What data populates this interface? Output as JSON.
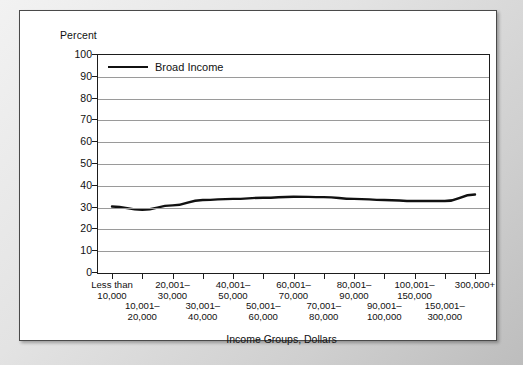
{
  "chart_data": {
    "type": "line",
    "title": "",
    "ylabel": "Percent",
    "xlabel": "Income Groups, Dollars",
    "ylim": [
      0,
      100
    ],
    "yticks": [
      0,
      10,
      20,
      30,
      40,
      50,
      60,
      70,
      80,
      90,
      100
    ],
    "grid": true,
    "legend_position": "top-left",
    "legend": [
      "Broad Income"
    ],
    "categories": [
      "Less than 10,000",
      "10,001– 20,000",
      "20,001– 30,000",
      "30,001– 40,000",
      "40,001– 50,000",
      "50,001– 60,000",
      "60,001– 70,000",
      "70,001– 80,000",
      "80,001– 90,000",
      "90,001– 100,000",
      "100,001– 150,000",
      "150,001– 300,000",
      "300,000+"
    ],
    "category_rows": [
      {
        "row": "a",
        "line1": "Less than",
        "line2": "10,000"
      },
      {
        "row": "b",
        "line1": "10,001–",
        "line2": "20,000"
      },
      {
        "row": "a",
        "line1": "20,001–",
        "line2": "30,000"
      },
      {
        "row": "b",
        "line1": "30,001–",
        "line2": "40,000"
      },
      {
        "row": "a",
        "line1": "40,001–",
        "line2": "50,000"
      },
      {
        "row": "b",
        "line1": "50,001–",
        "line2": "60,000"
      },
      {
        "row": "a",
        "line1": "60,001–",
        "line2": "70,000"
      },
      {
        "row": "b",
        "line1": "70,001–",
        "line2": "80,000"
      },
      {
        "row": "a",
        "line1": "80,001–",
        "line2": "90,000"
      },
      {
        "row": "b",
        "line1": "90,001–",
        "line2": "100,000"
      },
      {
        "row": "a",
        "line1": "100,001–",
        "line2": "150,000"
      },
      {
        "row": "b",
        "line1": "150,001–",
        "line2": "300,000"
      },
      {
        "row": "a",
        "line1": "300,000+",
        "line2": ""
      }
    ],
    "series": [
      {
        "name": "Broad Income",
        "color": "#111111",
        "values": [
          30.5,
          29,
          31,
          33.5,
          34,
          34.5,
          35,
          34.8,
          34,
          33.5,
          33,
          33,
          36
        ]
      }
    ]
  },
  "ytick_labels": [
    "100",
    "90",
    "80",
    "70",
    "60",
    "50",
    "40",
    "30",
    "20",
    "10",
    "0"
  ],
  "legend_label": "Broad Income",
  "y_axis_title": "Percent",
  "x_axis_title": "Income Groups, Dollars"
}
